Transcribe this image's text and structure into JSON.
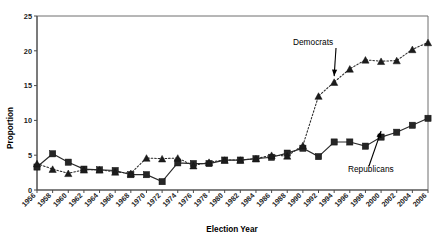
{
  "chart_data": {
    "type": "line",
    "title": "",
    "xlabel": "Election Year",
    "ylabel": "Proportion",
    "ylim": [
      0,
      25
    ],
    "yticks": [
      0,
      5,
      10,
      15,
      20,
      25
    ],
    "grid": false,
    "legend_position": "inline-annotations",
    "categories": [
      "1956",
      "1958",
      "1960",
      "1962",
      "1964",
      "1966",
      "1968",
      "1970",
      "1972",
      "1974",
      "1976",
      "1978",
      "1980",
      "1982",
      "1984",
      "1986",
      "1988",
      "1990",
      "1992",
      "1994",
      "1996",
      "1998",
      "2000",
      "2002",
      "2004",
      "2006"
    ],
    "series": [
      {
        "name": "Republicans",
        "marker": "square",
        "linestyle": "solid",
        "values": [
          3.3,
          5.2,
          4.0,
          3.0,
          2.9,
          2.8,
          2.2,
          2.2,
          1.2,
          3.9,
          3.8,
          3.8,
          4.3,
          4.3,
          4.5,
          4.7,
          5.3,
          6.0,
          4.8,
          6.9,
          6.9,
          6.3,
          7.6,
          8.3,
          9.3,
          10.3
        ]
      },
      {
        "name": "Democrats",
        "marker": "triangle",
        "linestyle": "dotted",
        "values": [
          3.8,
          3.0,
          2.4,
          2.9,
          2.9,
          2.6,
          2.4,
          4.6,
          4.5,
          4.6,
          3.5,
          4.0,
          4.3,
          4.3,
          4.5,
          5.0,
          4.9,
          6.4,
          13.5,
          15.5,
          17.4,
          18.7,
          18.5,
          18.6,
          20.2,
          21.2
        ]
      }
    ],
    "annotations": [
      {
        "text": "Democrats",
        "points_to_series": "Democrats",
        "points_to_category": "1994"
      },
      {
        "text": "Republicans",
        "points_to_series": "Republicans",
        "points_to_category": "2000"
      }
    ]
  }
}
